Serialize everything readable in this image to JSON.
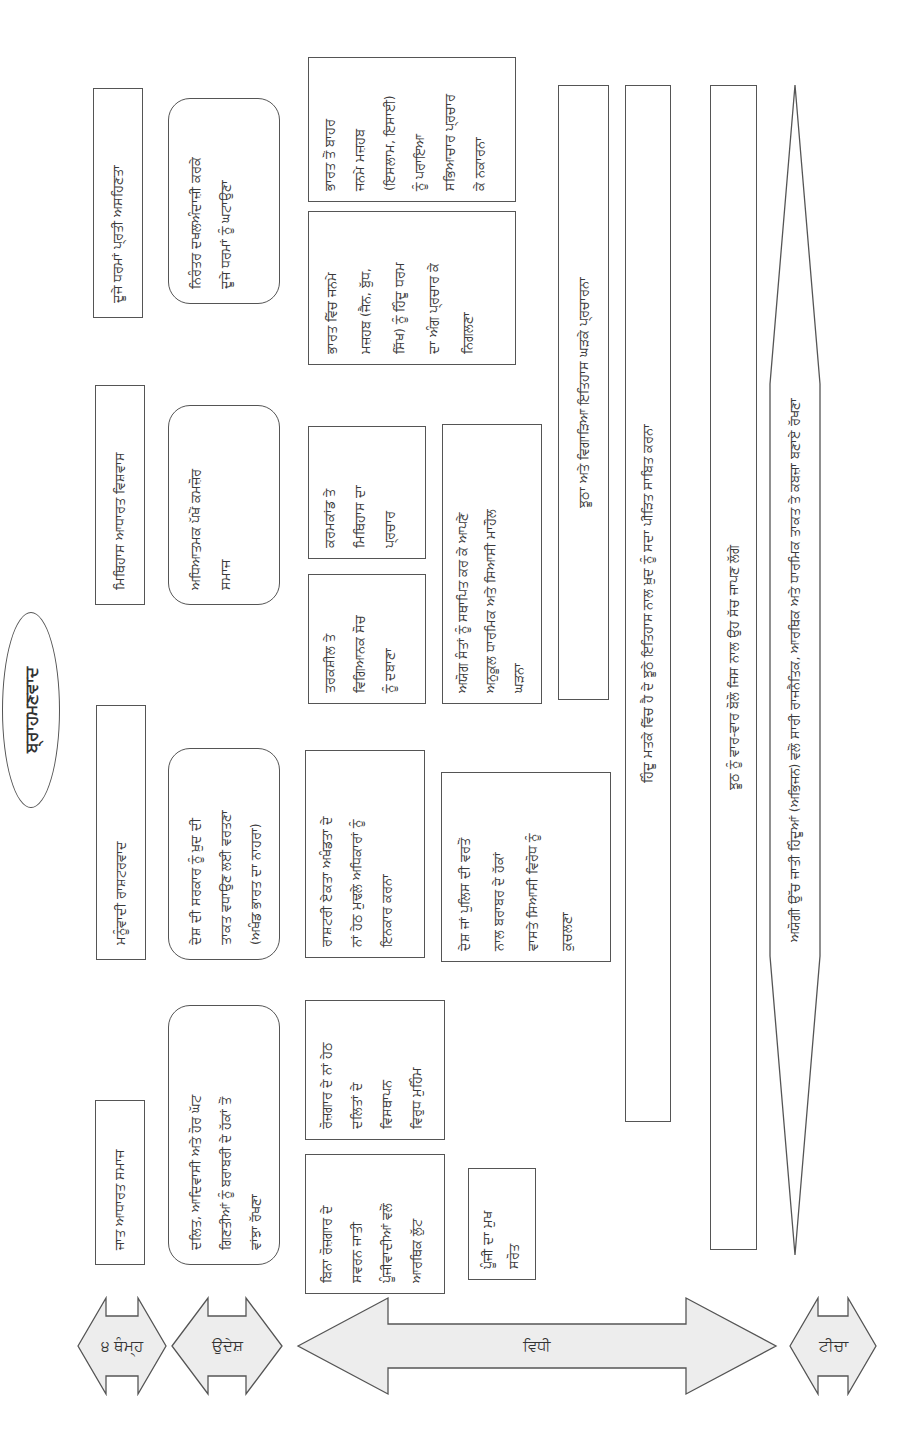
{
  "title": "ਬ੍ਰਾਹਮਣਵਾਦ",
  "side_arrows": [
    {
      "id": "pillars",
      "label": "੪ ਥੰਮ੍ਹ"
    },
    {
      "id": "objectives",
      "label": "ਉਦੇਸ਼"
    },
    {
      "id": "method",
      "label": "ਵਿਧੀ"
    },
    {
      "id": "target",
      "label": "ਟੀਚਾ"
    }
  ],
  "pillars": [
    {
      "label": "ਜਾਤ ਆਧਾਰਤ ਸਮਾਜ"
    },
    {
      "label": "ਮਨੂੰਵਾਦੀ ਰਾਸ਼ਟਰਵਾਦ"
    },
    {
      "label": "ਮਿਥਿਹਾਸ ਆਧਾਰਤ ਵਿਸ਼ਵਾਸ"
    },
    {
      "label": "ਦੂਜੇ ਧਰਮਾਂ ਪ੍ਰਤੀ ਅਸਹਿਣਤਾ"
    }
  ],
  "objectives": [
    {
      "lines": [
        "ਦਲਿਤ, ਆਦਿਵਾਸੀ ਅਤੇ ਹੋਰ ਘੱਟ",
        "ਗਿਣਤੀਆਂ ਨੂੰ ਬਰਾਬਰੀ ਦੇ ਹੱਕਾਂ ਤੋਂ",
        "ਵਾਂਝਾ ਰੱਖਣਾ"
      ]
    },
    {
      "lines": [
        "ਦੇਸ਼ ਦੀ ਸਰਕਾਰ ਨੂੰ ਖ਼ੁਦ ਦੀ",
        "ਤਾਕਤ ਵਧਾਉਣ ਲਈ ਵਰਤਣਾ",
        "(ਅਖੰਡ ਭਾਰਤ ਦਾ ਨਾਹਰਾ)"
      ]
    },
    {
      "lines": [
        "ਅਧਿਆਤਮਕ ਪੱਖੋਂ ਕਮਜ਼ੋਰ",
        "ਸਮਾਜ"
      ]
    },
    {
      "lines": [
        "ਨਿਰੰਤਰ ਦਖਲਅੰਦਾਜ਼ੀ ਕਰਕੇ",
        "ਦੂਜੇ ਧਰਮਾਂ ਨੂੰ ਘਟਾਉਣਾ"
      ]
    }
  ],
  "methods": {
    "col1": [
      {
        "lines": [
          "ਬਿਨਾ ਰੋਜ਼ਗਾਰ ਦੇ",
          "ਸਵਰਨ ਜਾਤੀ",
          "ਪੂੰਜੀਵਾਦੀਆਂ ਵਲੋਂ",
          "ਆਰਥਿਕ ਲੁੱਟ"
        ]
      },
      {
        "lines": [
          "ਰੋਜ਼ਗਾਰ ਦੇ ਨਾਂ ਹੇਠ",
          "ਦਲਿਤਾਂ ਦੇ",
          "ਵਿਸਥਾਪਨ",
          "ਵਿਰੁਧ ਮੁਹਿੰਮ"
        ]
      },
      {
        "lines": [
          "ਪੂੰਜੀ ਦਾ ਮੁਖ",
          "ਸਰੋਤ"
        ]
      }
    ],
    "col2": [
      {
        "lines": [
          "ਰਾਸ਼ਟਰੀ ਏਕਤਾ ਅਖੰਡਤਾ ਦੇ",
          "ਨਾਂ ਹੇਠ ਮੁਢਲੇ ਅਧਿਕਾਰਾਂ ਨੂੰ",
          "ਇਨਕਾਰ ਕਰਨਾ"
        ]
      },
      {
        "lines": [
          "ਦੇਸ਼ ਜਾਂ ਪੁਲਿਸ ਦੀ ਵਰਤੋਂ",
          "ਨਾਲ ਬਰਾਬਰ ਦੇ ਹੱਕਾਂ",
          "ਵਾਸਤੇ ਸਿਆਸੀ ਵਿਰੋਧ ਨੂੰ",
          "ਕੁਚਲਣਾ"
        ]
      }
    ],
    "col3": [
      {
        "lines": [
          "ਤਰਕਸ਼ੀਲ ਤੇ",
          "ਵਿਗਿਆਨਕ ਸੋਚ",
          "ਨੂੰ ਦਬਾਣਾ"
        ]
      },
      {
        "lines": [
          "ਕਰਮਕਾਂਡ ਤੇ",
          "ਮਿਥਿਹਾਸ ਦਾ",
          "ਪ੍ਰਚਾਰ"
        ]
      },
      {
        "lines": [
          "ਅਯੋਗ ਸੰਤਾਂ ਨੂੰ ਸਥਾਪਿਤ ਕਰ ਕੇ ਆਪਣੇ",
          "ਅਨੁਕੂਲ ਧਾਰਮਿਕ ਅਤੇ ਸਿਆਸੀ ਮਾਹੌਲ",
          "ਘੜਨਾ"
        ]
      }
    ],
    "col4": [
      {
        "lines": [
          "ਭਾਰਤ ਵਿੱਚ ਜਨਮੇ",
          "ਮਜ਼ਹਬ (ਜੈਨ, ਬੁੱਧ,",
          "ਸਿੱਖ) ਨੂੰ ਹਿੰਦੂ ਧਰਮ",
          "ਦਾ ਅੰਗ ਪ੍ਰਚਾਰ ਕੇ",
          "ਨਿਗਲਣਾ"
        ]
      },
      {
        "lines": [
          "ਭਾਰਤ ਤੋਂ ਬਾਹਰ",
          "ਜਨਮੇ ਮਜ਼ਹਬ",
          "(ਇਸਲਾਮ, ਇਸਾਈ)",
          "ਨੂੰ ਪਰਾਇਆ",
          "ਸਭਿਆਚਾਰ ਪ੍ਰਚਾਰ",
          "ਕੇ ਨਕਾਰਨਾ"
        ]
      }
    ]
  },
  "bars": [
    {
      "label": "ਝੂਠਾ ਅਤੇ ਵਿਗਾੜਿਆ ਇਤਿਹਾਸ ਘੜਕੇ ਪ੍ਰਚਾਰਨਾ"
    },
    {
      "label": "ਹਿੰਦੂ ਮਤਕੇ ਵਿੱਚ ਹੈ ਦੇ ਝੂਠੇ ਇਤਿਹਾਸ ਨਾਲ ਖ਼ੁਦ ਨੂੰ ਸਦਾ ਪੀੜਿਤ ਸਾਬਿਤ ਕਰਨਾ"
    },
    {
      "label": "ਝੂਠ ਨੂੰ ਵਾਰ-ਵਾਰ ਬੋਲੋ ਜਿਸ ਨਾਲ ਉਹ ਸੱਚ ਜਾਪਣ ਲੱਗੇ"
    }
  ],
  "goal": {
    "label": "ਅਯੋਗੀ ਉੱਚ ਜਾਤੀ ਹਿੰਦੂਆਂ (ਅਭਿਜਨ) ਵਲੋਂ ਸਾਰੀ ਰਾਜਨੈਤਿਕ, ਆਰਥਿਕ ਅਤੇ ਧਾਰਮਿਕ ਤਾਕਤ ਤੇ ਕਬਜ਼ਾ ਬਣਾਏ ਰੱਖਣਾ"
  },
  "colors": {
    "stroke": "#555555",
    "arrow_fill": "#ededed",
    "background": "#ffffff"
  }
}
